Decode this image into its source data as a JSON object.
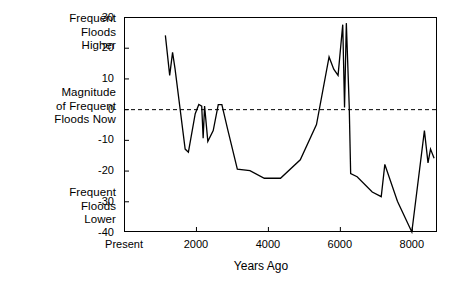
{
  "annotations": {
    "upper": "Frequent\nFloods\nHigher",
    "middle": "Magnitude\nof Frequent\nFloods Now",
    "lower": "Frequent\nFloods\nLower"
  },
  "axes": {
    "x_title": "Years Ago",
    "y_ticks": [
      "30",
      "20",
      "10",
      "0",
      "-10",
      "-20",
      "-30",
      "-40"
    ],
    "x_ticks": [
      "Present",
      "2000",
      "4000",
      "6000",
      "8000"
    ]
  },
  "chart_data": {
    "type": "line",
    "title": "",
    "subtitle": "",
    "xlabel": "Years Ago",
    "ylabel": "",
    "xlim": [
      0,
      8700
    ],
    "ylim": [
      -40,
      30
    ],
    "grid": false,
    "legend": null,
    "reference_lines": [
      {
        "axis": "y",
        "value": 0,
        "style": "dashed",
        "label": "Magnitude of Frequent Floods Now"
      }
    ],
    "y_tick_values": [
      30,
      20,
      10,
      0,
      -10,
      -20,
      -30,
      -40
    ],
    "x_tick_values": [
      0,
      2000,
      4000,
      6000,
      8000
    ],
    "x_tick_labels": [
      "Present",
      "2000",
      "4000",
      "6000",
      "8000"
    ],
    "axis_annotations": {
      "y_top": "Frequent Floods Higher",
      "y_zero": "Magnitude of Frequent Floods Now",
      "y_bottom": "Frequent Floods Lower"
    },
    "series": [
      {
        "name": "flood magnitude anomaly",
        "color": "#000000",
        "points": [
          [
            1150,
            24.0
          ],
          [
            1270,
            11.0
          ],
          [
            1350,
            18.5
          ],
          [
            1420,
            13.0
          ],
          [
            1700,
            -13.0
          ],
          [
            1790,
            -14.0
          ],
          [
            1980,
            -1.5
          ],
          [
            2080,
            1.5
          ],
          [
            2160,
            1.0
          ],
          [
            2200,
            -9.5
          ],
          [
            2240,
            1.0
          ],
          [
            2330,
            -10.5
          ],
          [
            2480,
            -7.0
          ],
          [
            2620,
            1.5
          ],
          [
            2720,
            1.5
          ],
          [
            2880,
            -6.5
          ],
          [
            3150,
            -19.5
          ],
          [
            3500,
            -20.0
          ],
          [
            3900,
            -22.5
          ],
          [
            4350,
            -22.5
          ],
          [
            4900,
            -16.5
          ],
          [
            5350,
            -5.0
          ],
          [
            5700,
            17.0
          ],
          [
            5830,
            13.0
          ],
          [
            5950,
            11.0
          ],
          [
            6080,
            27.5
          ],
          [
            6130,
            0.5
          ],
          [
            6180,
            28.0
          ],
          [
            6260,
            1.0
          ],
          [
            6300,
            -21.0
          ],
          [
            6480,
            -22.0
          ],
          [
            6900,
            -27.0
          ],
          [
            7150,
            -28.5
          ],
          [
            7250,
            -18.0
          ],
          [
            7600,
            -30.0
          ],
          [
            8000,
            -40.0
          ],
          [
            8350,
            -7.0
          ],
          [
            8450,
            -17.5
          ],
          [
            8520,
            -13.0
          ],
          [
            8620,
            -16.0
          ]
        ]
      }
    ]
  },
  "geometry": {
    "plot_left": 124,
    "plot_right": 437,
    "plot_top": 17,
    "plot_bottom": 232
  }
}
